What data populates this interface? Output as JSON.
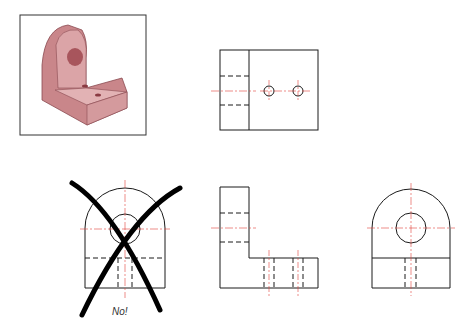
{
  "figure": {
    "type": "orthographic-projection",
    "views": [
      {
        "name": "isometric",
        "label": ""
      },
      {
        "name": "top-view",
        "label": ""
      },
      {
        "name": "front-view-incorrect",
        "label": ""
      },
      {
        "name": "front-view",
        "label": ""
      },
      {
        "name": "side-view",
        "label": ""
      }
    ],
    "wrong_label": "No!",
    "colors": {
      "line": "#1a1a1a",
      "center": "#e0403a",
      "part": "#c9868a",
      "cross": "#000000"
    }
  }
}
